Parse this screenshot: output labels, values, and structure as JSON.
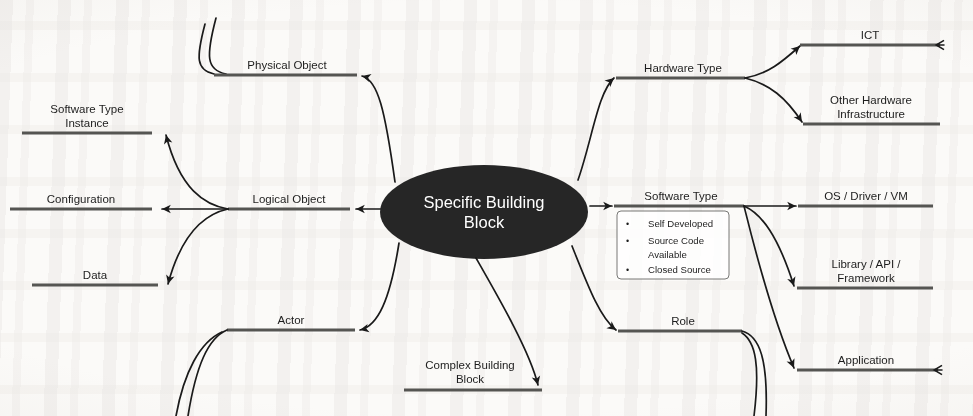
{
  "diagram": {
    "center": {
      "label_line1": "Specific Building",
      "label_line2": "Block"
    },
    "colors": {
      "center_fill": "#262626",
      "center_text": "#ffffff",
      "connector": "#1a1a1a",
      "underline": "#555552",
      "page": "#fbfaf8"
    },
    "nodes": {
      "physical_object": "Physical Object",
      "logical_object": "Logical Object",
      "actor": "Actor",
      "complex_building_block_line1": "Complex Building",
      "complex_building_block_line2": "Block",
      "software_type_instance_line1": "Software Type",
      "software_type_instance_line2": "Instance",
      "configuration": "Configuration",
      "data": "Data",
      "hardware_type": "Hardware Type",
      "software_type": "Software Type",
      "role": "Role",
      "ict": "ICT",
      "other_hardware_line1": "Other Hardware",
      "other_hardware_line2": "Infrastructure",
      "os_driver_vm": "OS / Driver / VM",
      "library_api_line1": "Library / API /",
      "library_api_line2": "Framework",
      "application": "Application"
    },
    "note_software_type": {
      "bullet_char": "•",
      "items": [
        {
          "line1": "Self Developed",
          "line2": ""
        },
        {
          "line1": "Source Code",
          "line2": "Available"
        },
        {
          "line1": "Closed Source",
          "line2": ""
        }
      ]
    }
  }
}
